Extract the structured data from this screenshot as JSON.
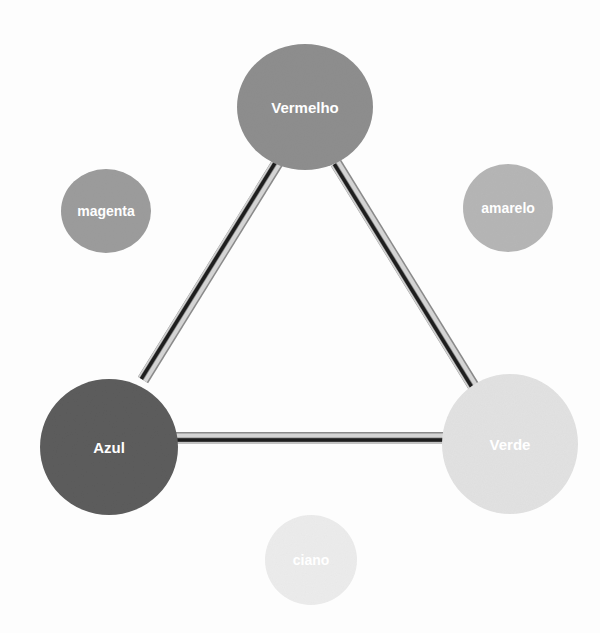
{
  "diagram": {
    "type": "color-triangle",
    "primary_nodes": [
      {
        "id": "vermelho",
        "label": "Vermelho",
        "cx": 305,
        "cy": 107,
        "rx": 68,
        "ry": 63,
        "color": "#8e8e8e",
        "font_size": 15
      },
      {
        "id": "azul",
        "label": "Azul",
        "cx": 109,
        "cy": 447,
        "rx": 69,
        "ry": 68,
        "color": "#5c5c5c",
        "font_size": 15
      },
      {
        "id": "verde",
        "label": "Verde",
        "cx": 510,
        "cy": 444,
        "rx": 68,
        "ry": 70,
        "color": "#e2e2e2",
        "font_size": 15
      }
    ],
    "secondary_nodes": [
      {
        "id": "magenta",
        "label": "magenta",
        "cx": 106,
        "cy": 211,
        "rx": 45,
        "ry": 42,
        "color": "#9c9c9c",
        "font_size": 14
      },
      {
        "id": "amarelo",
        "label": "amarelo",
        "cx": 508,
        "cy": 208,
        "rx": 45,
        "ry": 44,
        "color": "#b6b6b6",
        "font_size": 14
      },
      {
        "id": "ciano",
        "label": "ciano",
        "cx": 311,
        "cy": 560,
        "rx": 46,
        "ry": 45,
        "color": "#ececec",
        "font_size": 14
      }
    ],
    "connectors": [
      {
        "id": "vermelho-azul",
        "from": "Vermelho",
        "to": "Azul",
        "x1": 278,
        "y1": 162,
        "x2": 143,
        "y2": 380
      },
      {
        "id": "vermelho-verde",
        "from": "Vermelho",
        "to": "Verde",
        "x1": 336,
        "y1": 163,
        "x2": 476,
        "y2": 390
      },
      {
        "id": "azul-verde",
        "from": "Azul",
        "to": "Verde",
        "x1": 176,
        "y1": 438,
        "x2": 444,
        "y2": 438
      }
    ],
    "connector_style": {
      "outer": "#8a8a8a",
      "light": "#d4d4d4",
      "dark": "#1e1e1e"
    }
  }
}
